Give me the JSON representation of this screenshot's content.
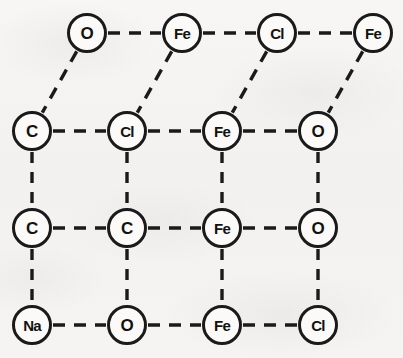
{
  "figure": {
    "background_color": "#f4f3f1",
    "stroke_color": "#1a1a1a",
    "node_fill_color": "#fbfaf8",
    "node_radius": 20,
    "bond_style": "dashed"
  },
  "nodes": [
    {
      "id": "n-r0c1",
      "label": "O",
      "row": 0,
      "col": 1,
      "x": 87,
      "y": 33
    },
    {
      "id": "n-r0c2",
      "label": "Fe",
      "row": 0,
      "col": 2,
      "x": 182,
      "y": 33
    },
    {
      "id": "n-r0c3",
      "label": "Cl",
      "row": 0,
      "col": 3,
      "x": 277,
      "y": 33
    },
    {
      "id": "n-r0c4",
      "label": "Fe",
      "row": 0,
      "col": 4,
      "x": 373,
      "y": 33
    },
    {
      "id": "n-r1c1",
      "label": "C",
      "row": 1,
      "col": 1,
      "x": 32,
      "y": 131
    },
    {
      "id": "n-r1c2",
      "label": "Cl",
      "row": 1,
      "col": 2,
      "x": 127,
      "y": 131
    },
    {
      "id": "n-r1c3",
      "label": "Fe",
      "row": 1,
      "col": 3,
      "x": 222,
      "y": 131
    },
    {
      "id": "n-r1c4",
      "label": "O",
      "row": 1,
      "col": 4,
      "x": 318,
      "y": 131
    },
    {
      "id": "n-r2c1",
      "label": "C",
      "row": 2,
      "col": 1,
      "x": 32,
      "y": 228
    },
    {
      "id": "n-r2c2",
      "label": "C",
      "row": 2,
      "col": 2,
      "x": 127,
      "y": 228
    },
    {
      "id": "n-r2c3",
      "label": "Fe",
      "row": 2,
      "col": 3,
      "x": 222,
      "y": 228
    },
    {
      "id": "n-r2c4",
      "label": "O",
      "row": 2,
      "col": 4,
      "x": 318,
      "y": 228
    },
    {
      "id": "n-r3c1",
      "label": "Na",
      "row": 3,
      "col": 1,
      "x": 32,
      "y": 325
    },
    {
      "id": "n-r3c2",
      "label": "O",
      "row": 3,
      "col": 2,
      "x": 127,
      "y": 325
    },
    {
      "id": "n-r3c3",
      "label": "Fe",
      "row": 3,
      "col": 3,
      "x": 222,
      "y": 325
    },
    {
      "id": "n-r3c4",
      "label": "Cl",
      "row": 3,
      "col": 4,
      "x": 318,
      "y": 325
    }
  ],
  "bonds": [
    {
      "from": "n-r0c1",
      "to": "n-r0c2",
      "kind": "horizontal"
    },
    {
      "from": "n-r0c2",
      "to": "n-r0c3",
      "kind": "horizontal"
    },
    {
      "from": "n-r0c3",
      "to": "n-r0c4",
      "kind": "horizontal"
    },
    {
      "from": "n-r0c1",
      "to": "n-r1c1",
      "kind": "diagonal"
    },
    {
      "from": "n-r0c2",
      "to": "n-r1c2",
      "kind": "diagonal"
    },
    {
      "from": "n-r0c3",
      "to": "n-r1c3",
      "kind": "diagonal"
    },
    {
      "from": "n-r0c4",
      "to": "n-r1c4",
      "kind": "diagonal"
    },
    {
      "from": "n-r1c1",
      "to": "n-r1c2",
      "kind": "horizontal"
    },
    {
      "from": "n-r1c2",
      "to": "n-r1c3",
      "kind": "horizontal"
    },
    {
      "from": "n-r1c3",
      "to": "n-r1c4",
      "kind": "horizontal"
    },
    {
      "from": "n-r2c1",
      "to": "n-r2c2",
      "kind": "horizontal"
    },
    {
      "from": "n-r2c2",
      "to": "n-r2c3",
      "kind": "horizontal"
    },
    {
      "from": "n-r2c3",
      "to": "n-r2c4",
      "kind": "horizontal"
    },
    {
      "from": "n-r3c1",
      "to": "n-r3c2",
      "kind": "horizontal"
    },
    {
      "from": "n-r3c2",
      "to": "n-r3c3",
      "kind": "horizontal"
    },
    {
      "from": "n-r3c3",
      "to": "n-r3c4",
      "kind": "horizontal"
    },
    {
      "from": "n-r1c1",
      "to": "n-r2c1",
      "kind": "vertical"
    },
    {
      "from": "n-r1c2",
      "to": "n-r2c2",
      "kind": "vertical"
    },
    {
      "from": "n-r1c3",
      "to": "n-r2c3",
      "kind": "vertical"
    },
    {
      "from": "n-r1c4",
      "to": "n-r2c4",
      "kind": "vertical"
    },
    {
      "from": "n-r2c1",
      "to": "n-r3c1",
      "kind": "vertical"
    },
    {
      "from": "n-r2c2",
      "to": "n-r3c2",
      "kind": "vertical"
    },
    {
      "from": "n-r2c3",
      "to": "n-r3c3",
      "kind": "vertical"
    },
    {
      "from": "n-r2c4",
      "to": "n-r3c4",
      "kind": "vertical"
    }
  ]
}
